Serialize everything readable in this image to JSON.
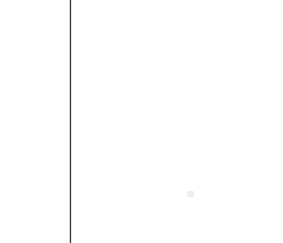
{
  "page": {
    "kind": "scanned-blank-page",
    "width_px": 283,
    "height_px": 243,
    "background_color": "#ffffff",
    "text_content": "",
    "visible_text_elements": []
  },
  "margin_rule": {
    "name": "vertical-margin-rule",
    "color": "#3a3a3c",
    "x_px": 70,
    "top_px": 0,
    "height_px": 243,
    "thickness_px": 1.4,
    "orientation": "vertical"
  },
  "artifacts": [
    {
      "name": "faint-speck",
      "color": "#d7d7de",
      "x_px": 187,
      "y_px": 191,
      "width_px": 7,
      "height_px": 6
    }
  ]
}
